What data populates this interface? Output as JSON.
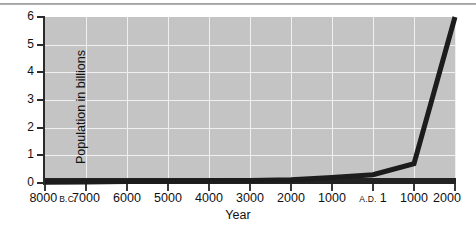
{
  "chart_data": {
    "type": "line",
    "title": "",
    "xlabel": "Year",
    "ylabel": "Population in billions",
    "x_tick_labels": [
      "8000",
      "7000",
      "6000",
      "5000",
      "4000",
      "3000",
      "2000",
      "1000",
      "1",
      "1000",
      "2000"
    ],
    "x_tick_eras": [
      "B.C.",
      "",
      "",
      "",
      "",
      "",
      "",
      "",
      "A.D.",
      "",
      ""
    ],
    "x_era_position": [
      "after",
      "",
      "",
      "",
      "",
      "",
      "",
      "",
      "before",
      "",
      ""
    ],
    "y_tick_labels": [
      "0",
      "1",
      "2",
      "3",
      "4",
      "5",
      "6"
    ],
    "ylim": [
      0,
      6
    ],
    "y_ticks": [
      0,
      1,
      2,
      3,
      4,
      5,
      6
    ],
    "grid": true,
    "legend": "none",
    "x_index": [
      0,
      1,
      2,
      3,
      4,
      5,
      6,
      7,
      8,
      9,
      10
    ],
    "x_years": [
      -8000,
      -7000,
      -6000,
      -5000,
      -4000,
      -3000,
      -2000,
      -1000,
      1,
      1000,
      2000
    ],
    "values": [
      0.03,
      0.04,
      0.05,
      0.06,
      0.07,
      0.09,
      0.12,
      0.2,
      0.3,
      0.7,
      6.0
    ],
    "plot_bg_color": "#c4c4c4",
    "grid_color": "#f0f0f0",
    "line_color": "#1c1c1c",
    "axis_color": "#232323"
  },
  "axes": {
    "x_title": "Year",
    "y_title": "Population in billions"
  }
}
